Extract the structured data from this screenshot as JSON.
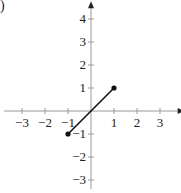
{
  "figure_label": ")",
  "chart_data": {
    "type": "line",
    "title": "",
    "xlabel": "",
    "ylabel": "",
    "xlim": [
      -3.9,
      3.9
    ],
    "ylim": [
      -3.4,
      4.6
    ],
    "xticks": [
      -3,
      -2,
      -1,
      1,
      2,
      3
    ],
    "yticks": [
      4,
      3,
      2,
      1,
      -1,
      -2,
      -3
    ],
    "xtick_labels": [
      "−3",
      "−2",
      "−1",
      "1",
      "2",
      "3"
    ],
    "ytick_labels": [
      "4",
      "3",
      "2",
      "1",
      "−1",
      "−2",
      "−3"
    ],
    "grid": false,
    "legend": null,
    "series": [
      {
        "name": "segment",
        "x": [
          -1,
          1
        ],
        "y": [
          -1,
          1
        ],
        "endpoints": "closed",
        "color": "#111111"
      }
    ]
  },
  "colors": {
    "axis": "#9a9a9a",
    "line": "#111111",
    "text": "#222222"
  }
}
